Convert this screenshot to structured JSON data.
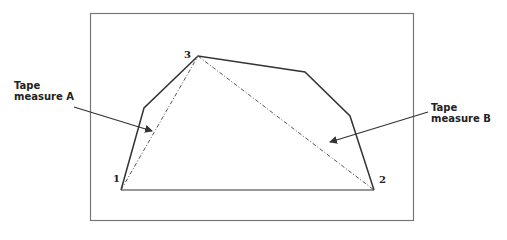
{
  "diagram": {
    "frame": {
      "x": 90,
      "y": 13,
      "w": 323,
      "h": 207,
      "color": "#777777"
    },
    "boundary_points": [
      [
        121,
        190
      ],
      [
        144,
        108
      ],
      [
        198,
        56
      ],
      [
        305,
        72
      ],
      [
        350,
        116
      ],
      [
        374,
        190
      ]
    ],
    "base_line": [
      [
        121,
        190
      ],
      [
        374,
        190
      ]
    ],
    "tape_a_line": [
      [
        121,
        190
      ],
      [
        198,
        56
      ]
    ],
    "tape_b_line": [
      [
        198,
        56
      ],
      [
        374,
        190
      ]
    ],
    "points": [
      {
        "label": "1",
        "x": 114,
        "y": 174
      },
      {
        "label": "2",
        "x": 379,
        "y": 174
      },
      {
        "label": "3",
        "x": 184,
        "y": 49
      }
    ],
    "labels": {
      "tape_a_line1": "Tape",
      "tape_a_line2": "measure A",
      "tape_b_line1": "Tape",
      "tape_b_line2": "measure B"
    },
    "arrow_a": {
      "from": [
        74,
        107
      ],
      "to": [
        152,
        131
      ]
    },
    "arrow_b": {
      "from": [
        428,
        112
      ],
      "to": [
        330,
        142
      ]
    },
    "line_color": "#333333"
  }
}
